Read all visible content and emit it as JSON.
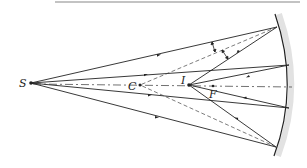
{
  "figure": {
    "type": "ray-diagram-concave-mirror",
    "labels": {
      "source": "S",
      "center": "C",
      "image": "I",
      "focus": "F"
    },
    "colors": {
      "ray": "#222222",
      "dashed": "#444444",
      "mirror": "#222222",
      "mirror_shade": "#d8d8d8",
      "top_rule": "#777777"
    }
  }
}
